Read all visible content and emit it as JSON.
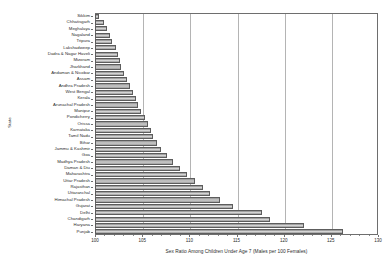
{
  "chart_data": {
    "type": "bar",
    "orientation": "horizontal",
    "title": "",
    "xlabel": "Sex Ratio Among Children Under Age 7 (Males per 100 Females)",
    "ylabel": "State",
    "xlim": [
      100,
      130
    ],
    "xticks": [
      100,
      105,
      110,
      115,
      120,
      125,
      130
    ],
    "grid": true,
    "legend": null,
    "categories": [
      "Sikkim",
      "Chhatisgarh",
      "Meghalaya",
      "Nagaland",
      "Tripura",
      "Lakshadweep",
      "Dadra & Nagar Haveli",
      "Mizoram",
      "Jharkhand",
      "Andaman & Nicobar",
      "Assam",
      "Andhra Pradesh",
      "West Bengal",
      "Kerala",
      "Arunachal Pradesh",
      "Manipur",
      "Pondicherry",
      "Orissa",
      "Karnataka",
      "Tamil Nadu",
      "Bihar",
      "Jammu & Kashmir",
      "Goa",
      "Madhya Pradesh",
      "Daman & Diu",
      "Maharashtra",
      "Uttar Pradesh",
      "Rajasthan",
      "Uttaranchal",
      "Himachal Pradesh",
      "Gujarat",
      "Delhi",
      "Chandigarh",
      "Haryana",
      "Punjab"
    ],
    "values": [
      100.4,
      101.0,
      101.3,
      101.6,
      101.8,
      102.2,
      102.4,
      102.6,
      102.8,
      103.1,
      103.4,
      103.7,
      104.0,
      104.3,
      104.6,
      104.9,
      105.3,
      105.6,
      105.9,
      106.2,
      106.6,
      107.0,
      107.6,
      108.3,
      109.0,
      109.8,
      110.6,
      111.4,
      112.2,
      113.2,
      114.6,
      117.7,
      118.6,
      122.2,
      126.3
    ]
  },
  "axis": {
    "x_title": "Sex Ratio Among Children Under Age 7 (Males per 100 Females)",
    "y_title": "State",
    "tick_labels": [
      "100",
      "105",
      "110",
      "115",
      "120",
      "125",
      "130"
    ]
  }
}
